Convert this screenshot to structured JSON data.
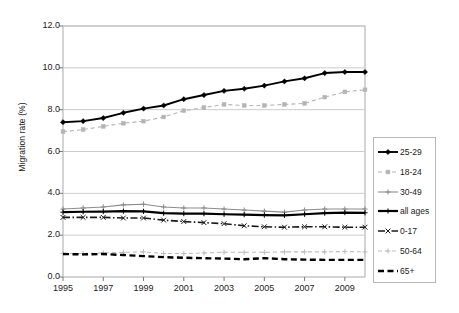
{
  "chart_data": {
    "type": "line",
    "title": "",
    "xlabel": "",
    "ylabel": "Migration rate (%)",
    "ylim": [
      0.0,
      12.0
    ],
    "ytick_step": 2.0,
    "ytick_labels": [
      "0.0",
      "2.0",
      "4.0",
      "6.0",
      "8.0",
      "10.0",
      "12.0"
    ],
    "ytick_values": [
      0.0,
      2.0,
      4.0,
      6.0,
      8.0,
      10.0,
      12.0
    ],
    "grid": true,
    "grid_axis": "y",
    "legend_position": "right-outside",
    "x": [
      1995,
      1996,
      1997,
      1998,
      1999,
      2000,
      2001,
      2002,
      2003,
      2004,
      2005,
      2006,
      2007,
      2008,
      2009,
      2010
    ],
    "xtick_labels": [
      "1995",
      "1997",
      "1999",
      "2001",
      "2003",
      "2005",
      "2007",
      "2009"
    ],
    "xtick_values": [
      1995,
      1997,
      1999,
      2001,
      2003,
      2005,
      2007,
      2009
    ],
    "series": [
      {
        "name": "25-29",
        "color": "#000000",
        "style": "solid",
        "marker": "diamond",
        "width": 1.9,
        "values": [
          7.4,
          7.45,
          7.6,
          7.85,
          8.05,
          8.2,
          8.5,
          8.7,
          8.9,
          9.0,
          9.15,
          9.35,
          9.5,
          9.75,
          9.8,
          9.8
        ]
      },
      {
        "name": "18-24",
        "color": "#b4b4b4",
        "style": "dashed",
        "marker": "square",
        "width": 1.1,
        "values": [
          6.95,
          7.05,
          7.2,
          7.35,
          7.45,
          7.65,
          7.95,
          8.1,
          8.25,
          8.2,
          8.2,
          8.25,
          8.3,
          8.6,
          8.85,
          8.95
        ]
      },
      {
        "name": "30-49",
        "color": "#8c8c8c",
        "style": "solid",
        "marker": "plus",
        "width": 1.1,
        "values": [
          3.25,
          3.3,
          3.35,
          3.45,
          3.48,
          3.35,
          3.3,
          3.3,
          3.25,
          3.2,
          3.15,
          3.1,
          3.2,
          3.25,
          3.25,
          3.25
        ]
      },
      {
        "name": "all ages",
        "color": "#000000",
        "style": "solid",
        "marker": "plus",
        "width": 2.2,
        "values": [
          3.1,
          3.12,
          3.13,
          3.15,
          3.14,
          3.05,
          3.03,
          3.03,
          3.0,
          2.98,
          2.96,
          2.95,
          3.0,
          3.05,
          3.08,
          3.07
        ]
      },
      {
        "name": "0-17",
        "color": "#1a1a1a",
        "style": "dashdot",
        "marker": "x",
        "width": 1.6,
        "values": [
          2.85,
          2.85,
          2.85,
          2.82,
          2.82,
          2.72,
          2.65,
          2.6,
          2.55,
          2.45,
          2.4,
          2.38,
          2.4,
          2.4,
          2.38,
          2.38
        ]
      },
      {
        "name": "50-64",
        "color": "#bdbdbd",
        "style": "dashed",
        "marker": "plus",
        "width": 1.1,
        "values": [
          1.12,
          1.12,
          1.15,
          1.18,
          1.2,
          1.12,
          1.12,
          1.15,
          1.18,
          1.18,
          1.18,
          1.2,
          1.2,
          1.2,
          1.22,
          1.2
        ]
      },
      {
        "name": "65+",
        "color": "#000000",
        "style": "dashed-heavy",
        "marker": "none",
        "width": 2.4,
        "values": [
          1.1,
          1.08,
          1.1,
          1.05,
          1.0,
          0.95,
          0.92,
          0.9,
          0.88,
          0.85,
          0.9,
          0.85,
          0.83,
          0.82,
          0.82,
          0.82
        ]
      }
    ]
  },
  "legend": {
    "entries": [
      "25-29",
      "18-24",
      "30-49",
      "all ages",
      "0-17",
      "50-64",
      "65+"
    ]
  }
}
